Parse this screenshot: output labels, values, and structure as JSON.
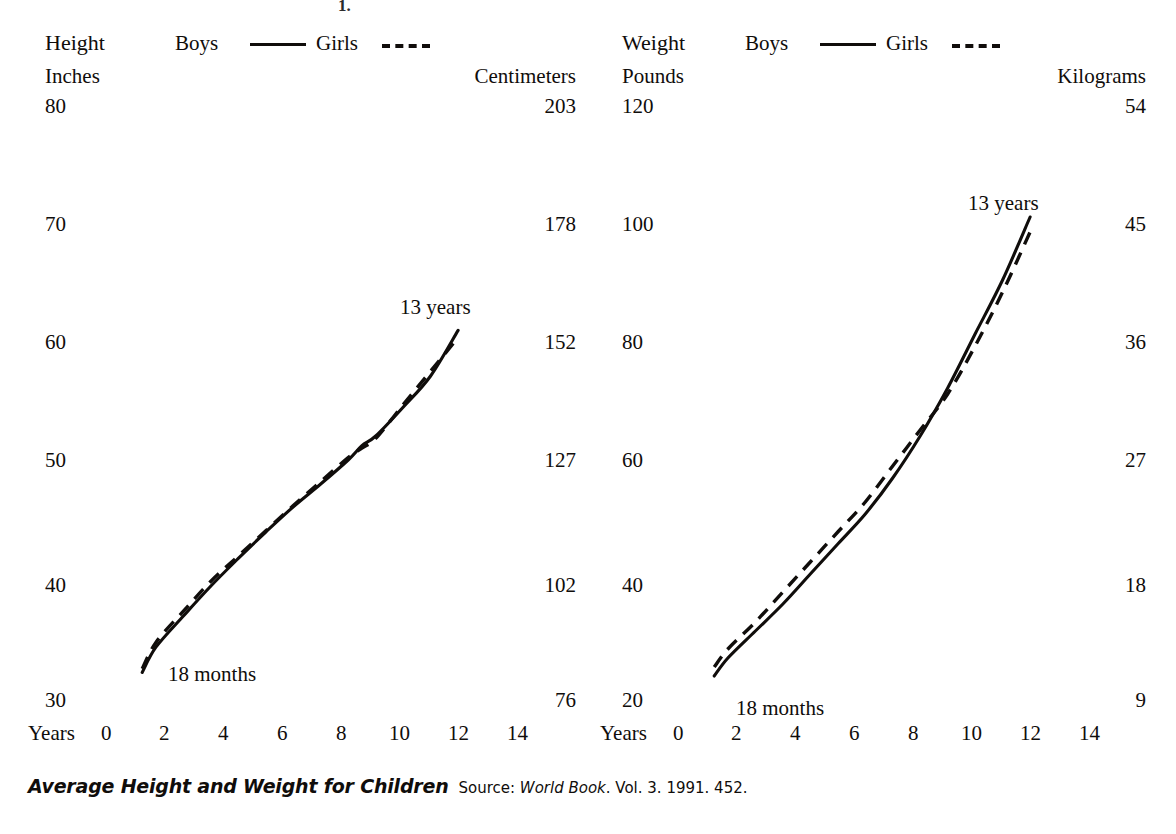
{
  "caption": {
    "title": "Average Height and Weight for Children",
    "source_prefix": "Source:",
    "source_work": "World Book",
    "source_rest": ". Vol. 3. 1991. 452."
  },
  "scan_artifact": "1.",
  "panels": [
    {
      "id": "height",
      "title": "Height",
      "left_axis_title": "Inches",
      "right_axis_title": "Centimeters",
      "x_axis_title": "Years",
      "legend": [
        {
          "label": "Boys",
          "style": "solid"
        },
        {
          "label": "Girls",
          "style": "dashed"
        }
      ],
      "left_ticks": [
        "80",
        "70",
        "60",
        "50",
        "40",
        "30"
      ],
      "right_ticks": [
        "203",
        "178",
        "152",
        "127",
        "102",
        "76"
      ],
      "x_ticks": [
        "0",
        "2",
        "4",
        "6",
        "8",
        "10",
        "12",
        "14"
      ],
      "annotations": [
        {
          "text": "18 months",
          "at": "curve-start"
        },
        {
          "text": "13 years",
          "at": "curve-end"
        }
      ]
    },
    {
      "id": "weight",
      "title": "Weight",
      "left_axis_title": "Pounds",
      "right_axis_title": "Kilograms",
      "x_axis_title": "Years",
      "legend": [
        {
          "label": "Boys",
          "style": "solid"
        },
        {
          "label": "Girls",
          "style": "dashed"
        }
      ],
      "left_ticks": [
        "120",
        "100",
        "80",
        "60",
        "40",
        "20"
      ],
      "right_ticks": [
        "54",
        "45",
        "36",
        "27",
        "18",
        "9"
      ],
      "x_ticks": [
        "0",
        "2",
        "4",
        "6",
        "8",
        "10",
        "12",
        "14"
      ],
      "annotations": [
        {
          "text": "18 months",
          "at": "curve-start"
        },
        {
          "text": "13 years",
          "at": "curve-end"
        }
      ]
    }
  ],
  "chart_data": [
    {
      "type": "line",
      "title": "Height",
      "xlabel": "Years",
      "ylabel": "Inches",
      "y2label": "Centimeters",
      "xlim": [
        0,
        15
      ],
      "ylim": [
        30,
        80
      ],
      "y2lim": [
        76,
        203
      ],
      "ytick_labels": [
        80,
        70,
        60,
        50,
        40,
        30
      ],
      "y2tick_labels": [
        203,
        178,
        152,
        127,
        102,
        76
      ],
      "xtick_labels": [
        0,
        2,
        4,
        6,
        8,
        10,
        12,
        14
      ],
      "grid": false,
      "legend_position": "top",
      "annotations": [
        "18 months",
        "13 years"
      ],
      "x": [
        1.5,
        2,
        3,
        4,
        5,
        6,
        7,
        8,
        9,
        9.5,
        10,
        11,
        12,
        13
      ],
      "series": [
        {
          "name": "Boys",
          "style": "solid",
          "units": "inches",
          "values": [
            32.3,
            34.4,
            37.0,
            39.5,
            41.8,
            44.0,
            46.1,
            48.0,
            50.0,
            51.2,
            52.0,
            54.4,
            57.0,
            60.8
          ]
        },
        {
          "name": "Girls",
          "style": "dashed",
          "units": "inches",
          "values": [
            32.6,
            34.8,
            37.4,
            39.9,
            42.0,
            44.1,
            46.2,
            48.2,
            50.2,
            51.0,
            51.8,
            54.6,
            57.4,
            60.2
          ]
        }
      ]
    },
    {
      "type": "line",
      "title": "Weight",
      "xlabel": "Years",
      "ylabel": "Pounds",
      "y2label": "Kilograms",
      "xlim": [
        0,
        15
      ],
      "ylim": [
        20,
        120
      ],
      "y2lim": [
        9,
        54
      ],
      "ytick_labels": [
        120,
        100,
        80,
        60,
        40,
        20
      ],
      "y2tick_labels": [
        54,
        45,
        36,
        27,
        18,
        9
      ],
      "xtick_labels": [
        0,
        2,
        4,
        6,
        8,
        10,
        12,
        14
      ],
      "grid": false,
      "legend_position": "top",
      "annotations": [
        "18 months",
        "13 years"
      ],
      "x": [
        1.5,
        2,
        3,
        4,
        5,
        6,
        7,
        8,
        9,
        10,
        11,
        12,
        13
      ],
      "series": [
        {
          "name": "Boys",
          "style": "solid",
          "units": "pounds",
          "values": [
            24.0,
            27.0,
            31.5,
            36.0,
            41.0,
            46.0,
            51.0,
            57.0,
            64.0,
            72.0,
            81.0,
            90.0,
            100.5
          ]
        },
        {
          "name": "Girls",
          "style": "dashed",
          "units": "pounds",
          "values": [
            25.5,
            28.5,
            33.0,
            38.0,
            43.0,
            48.0,
            53.0,
            59.0,
            65.0,
            71.0,
            79.0,
            88.0,
            98.0
          ]
        }
      ]
    }
  ]
}
